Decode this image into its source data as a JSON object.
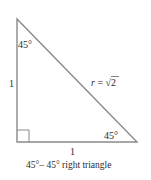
{
  "diagram": {
    "type": "right-triangle",
    "colors": {
      "stroke": "#8a8a8a",
      "text": "#2b2b2b",
      "background": "#ffffff"
    },
    "vertices": {
      "top": [
        17,
        19
      ],
      "bottom_left": [
        17,
        142
      ],
      "bottom_right": [
        137,
        142
      ]
    },
    "right_angle_marker": {
      "corner": "bottom_left",
      "size": 12
    },
    "labels": {
      "top_angle": "45°",
      "bottom_right_angle": "45°",
      "vertical_side": "1",
      "horizontal_side": "1",
      "hypotenuse_var": "r",
      "hypotenuse_eq": " = ",
      "hypotenuse_sqrt": "√",
      "hypotenuse_val": "2",
      "caption": "45°– 45° right triangle"
    }
  }
}
